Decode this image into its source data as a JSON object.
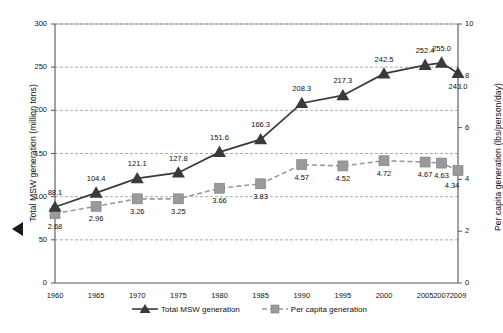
{
  "chart_data": {
    "type": "line",
    "title": "",
    "subtitle": "",
    "xlabel": "",
    "ylabel": "Total MSW generation (million tons)",
    "y2label": "Per capita generation (lbs/person/day)",
    "grid": true,
    "legend_position": "bottom-center",
    "categories": [
      "1960",
      "1965",
      "1970",
      "1975",
      "1980",
      "1985",
      "1990",
      "1995",
      "2000",
      "2005",
      "2007",
      "2009"
    ],
    "ylim": [
      0,
      300
    ],
    "yticks": [
      "0",
      "50",
      "100",
      "150",
      "200",
      "250",
      "300"
    ],
    "y2lim": [
      0,
      10
    ],
    "y2ticks": [
      "0",
      "2",
      "4",
      "6",
      "8",
      "10"
    ],
    "series": [
      {
        "name": "Total MSW generation",
        "axis": "left",
        "marker": "triangle",
        "line_style": "solid",
        "color": "#3a3a3a",
        "values": [
          88.1,
          104.4,
          121.1,
          127.8,
          151.6,
          166.3,
          208.3,
          217.3,
          242.5,
          252.4,
          255.0,
          243.0
        ],
        "labels": [
          "88.1",
          "104.4",
          "121.1",
          "127.8",
          "151.6",
          "166.3",
          "208.3",
          "217.3",
          "242.5",
          "252.4",
          "255.0",
          "243.0"
        ]
      },
      {
        "name": "Per capita generation",
        "axis": "right",
        "marker": "square",
        "line_style": "dashed",
        "color": "#9a9a9a",
        "values": [
          2.68,
          2.96,
          3.25,
          3.25,
          3.66,
          3.83,
          4.57,
          4.52,
          4.72,
          4.67,
          4.63,
          4.34
        ],
        "labels": [
          "2.68",
          "2.96",
          "3.26",
          "3.25",
          "3.66",
          "3.83",
          "4.57",
          "4.52",
          "4.72",
          "4.67",
          "4.63",
          "4.34"
        ]
      }
    ]
  },
  "legend": {
    "items": [
      {
        "label": "Total MSW generation",
        "color": "#3a3a3a",
        "marker": "triangle"
      },
      {
        "label": "Per capita generation",
        "color": "#9a9a9a",
        "marker": "square"
      }
    ]
  },
  "colors": {
    "series_primary": "#3a3a3a",
    "series_secondary": "#9a9a9a",
    "axis": "#555555",
    "grid": "#888888",
    "background": "#ffffff"
  }
}
